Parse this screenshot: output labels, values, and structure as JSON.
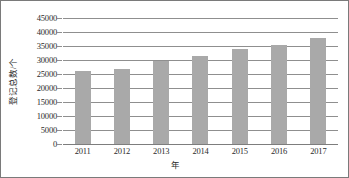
{
  "chart_data": {
    "type": "bar",
    "title": "",
    "xlabel": "年",
    "ylabel": "登记总数/个",
    "categories": [
      "2011",
      "2012",
      "2013",
      "2014",
      "2015",
      "2016",
      "2017"
    ],
    "values": [
      25900,
      26900,
      29700,
      31500,
      34000,
      35300,
      37800
    ],
    "ylim": [
      0,
      45000
    ],
    "ytick_values": [
      0,
      5000,
      10000,
      15000,
      20000,
      25000,
      30000,
      35000,
      40000,
      45000
    ],
    "ytick_labels": [
      "0",
      "5000",
      "10000",
      "15000",
      "20000",
      "25000",
      "30000",
      "35000",
      "40000",
      "45000"
    ],
    "grid": true,
    "legend": false,
    "series": [
      {
        "name": "登记总数",
        "values": [
          25900,
          26900,
          29700,
          31500,
          34000,
          35300,
          37800
        ]
      }
    ],
    "colors": {
      "bar": "#a9a9a9",
      "gridline": "#8f8f8f",
      "axis": "#7d7d7d",
      "text": "#2b2b2b",
      "border": "#7a7a7a",
      "background": "#ffffff"
    }
  }
}
